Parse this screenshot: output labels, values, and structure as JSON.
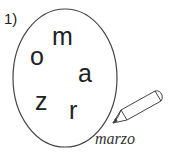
{
  "exercise": {
    "number_label": "1)",
    "letters": [
      "m",
      "o",
      "a",
      "z",
      "r"
    ],
    "answer_word": "marzo"
  }
}
